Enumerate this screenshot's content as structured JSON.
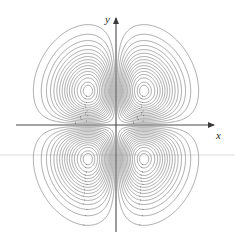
{
  "figure": {
    "title": "",
    "background_color": "#ffffff",
    "width": 235,
    "height": 250
  },
  "axes": {
    "x_label": "x",
    "y_label": "y",
    "axis_color": "#4a4a4a",
    "origin_px": [
      116,
      125
    ],
    "x_axis_y_px": 125,
    "y_axis_x_px": 116,
    "x_arrow_tip_px": [
      215,
      125
    ],
    "y_arrow_tip_px": [
      116,
      17
    ],
    "arrowheads": [
      "x-positive",
      "y-positive"
    ],
    "ticks": [],
    "tick_labels": [],
    "grid": false
  },
  "artifacts": {
    "scan_line_color": "#dcdcdc",
    "scan_line_y_px": 155
  },
  "chart_data": {
    "type": "line",
    "subtype": "contour",
    "title": "",
    "xlabel": "x",
    "ylabel": "y",
    "xlim": [
      -2.6,
      2.6
    ],
    "ylim": [
      -2.6,
      2.6
    ],
    "grid": false,
    "legend": null,
    "function": "z = x*y*exp(-x^2-y^2)",
    "contour_color": "#6e6e6e",
    "n_levels_per_lobe": 16,
    "extrema": [
      {
        "name": "upper-right-maximum",
        "x": 0.707,
        "y": 0.707,
        "z": 0.1839,
        "pixel": [
          144,
          91
        ],
        "sign": "positive"
      },
      {
        "name": "upper-left-minimum",
        "x": -0.707,
        "y": 0.707,
        "z": -0.1839,
        "pixel": [
          88,
          91
        ],
        "sign": "negative"
      },
      {
        "name": "lower-left-maximum",
        "x": -0.707,
        "y": -0.707,
        "z": 0.1839,
        "pixel": [
          88,
          158
        ],
        "sign": "positive"
      },
      {
        "name": "lower-right-minimum",
        "x": 0.707,
        "y": -0.707,
        "z": -0.1839,
        "pixel": [
          145,
          158
        ],
        "sign": "negative"
      }
    ],
    "saddle_points": [
      {
        "x": 0,
        "y": 0,
        "z": 0,
        "pixel": [
          116,
          125
        ]
      }
    ],
    "levels": [
      0.0115,
      0.023,
      0.0345,
      0.046,
      0.0575,
      0.069,
      0.0805,
      0.092,
      0.1035,
      0.115,
      0.1265,
      0.138,
      0.1495,
      0.161,
      0.1725,
      0.179
    ],
    "series": [
      {
        "name": "positive lobes",
        "values": [
          0.0115,
          0.023,
          0.0345,
          0.046,
          0.0575,
          0.069,
          0.0805,
          0.092,
          0.1035,
          0.115,
          0.1265,
          0.138,
          0.1495,
          0.161,
          0.1725,
          0.179
        ]
      },
      {
        "name": "negative lobes",
        "values": [
          -0.0115,
          -0.023,
          -0.0345,
          -0.046,
          -0.0575,
          -0.069,
          -0.0805,
          -0.092,
          -0.1035,
          -0.115,
          -0.1265,
          -0.138,
          -0.1495,
          -0.161,
          -0.1725,
          -0.179
        ]
      }
    ]
  }
}
